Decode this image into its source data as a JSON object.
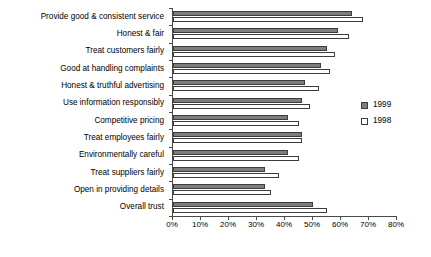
{
  "chart_data": {
    "type": "bar",
    "orientation": "horizontal",
    "title": "",
    "xlabel": "",
    "ylabel": "",
    "xlim": [
      0,
      80
    ],
    "xtick_labels": [
      "0%",
      "10%",
      "20%",
      "30%",
      "40%",
      "50%",
      "60%",
      "70%",
      "80%"
    ],
    "xtick_values": [
      0,
      10,
      20,
      30,
      40,
      50,
      60,
      70,
      80
    ],
    "grid": false,
    "legend_position": "right",
    "categories": [
      "Provide good & consistent service",
      "Honest & fair",
      "Treat customers fairly",
      "Good at handling complaints",
      "Honest & truthful advertising",
      "Use information responsibly",
      "Competitive pricing",
      "Treat employees fairly",
      "Environmentally careful",
      "Treat suppliers fairly",
      "Open in providing details",
      "Overall trust"
    ],
    "series": [
      {
        "name": "1999",
        "color": "#7d7d7d",
        "values": [
          64,
          59,
          55,
          53,
          47,
          46,
          41,
          46,
          41,
          33,
          33,
          50
        ]
      },
      {
        "name": "1998",
        "color": "#ffffff",
        "values": [
          68,
          63,
          58,
          56,
          52,
          49,
          45,
          46,
          45,
          38,
          35,
          55
        ]
      }
    ]
  },
  "legend": {
    "items": [
      {
        "label": "1999",
        "swatch": "filled-gray-swatch-icon"
      },
      {
        "label": "1998",
        "swatch": "open-white-swatch-icon"
      }
    ]
  }
}
